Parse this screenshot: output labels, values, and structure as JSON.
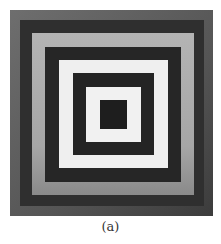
{
  "figure": {
    "caption": "(a)",
    "rings": [
      {
        "name": "outer-gray-band",
        "left": 10,
        "top": 10,
        "right": 213,
        "bottom": 216,
        "color": "#5e5e5e"
      },
      {
        "name": "outer-dark-band",
        "left": 20,
        "top": 20,
        "right": 204,
        "bottom": 206,
        "color": "#2f2f2f"
      },
      {
        "name": "light-gray-band",
        "left": 32,
        "top": 33,
        "right": 194,
        "bottom": 195,
        "color": "#a9a9a9"
      },
      {
        "name": "dark-band-2",
        "left": 45,
        "top": 47,
        "right": 181,
        "bottom": 182,
        "color": "#262626"
      },
      {
        "name": "white-band-1",
        "left": 59,
        "top": 60,
        "right": 168,
        "bottom": 168,
        "color": "#efefef"
      },
      {
        "name": "dark-band-3",
        "left": 73,
        "top": 73,
        "right": 154,
        "bottom": 155,
        "color": "#242424"
      },
      {
        "name": "white-band-2",
        "left": 86,
        "top": 87,
        "right": 141,
        "bottom": 142,
        "color": "#f1f1f1"
      },
      {
        "name": "center-dark-square",
        "left": 100,
        "top": 100,
        "right": 127,
        "bottom": 129,
        "color": "#1e1e1e"
      }
    ]
  }
}
